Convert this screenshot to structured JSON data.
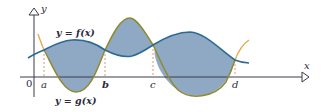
{
  "diagram": {
    "labels": {
      "y_axis": "y",
      "x_axis": "x",
      "origin": "0",
      "f_curve": "y = f(x)",
      "g_curve": "y = g(x)",
      "points": [
        "a",
        "b",
        "c",
        "d"
      ]
    },
    "colors": {
      "fill": "#8fa9c4",
      "f_curve": "#2f6a96",
      "g_curve": "#8f8a2e",
      "g_curve_outside": "#e3a84a",
      "guides": "#e0967a",
      "axes": "#3a3a4a"
    }
  }
}
